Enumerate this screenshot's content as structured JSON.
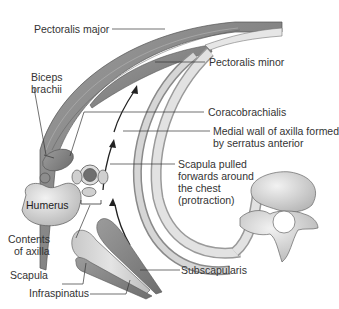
{
  "figure": {
    "type": "anatomical-diagram"
  },
  "labels": {
    "pectoralis_major": "Pectoralis major",
    "pectoralis_minor": "Pectoralis minor",
    "biceps_1": "Biceps",
    "biceps_2": "brachii",
    "coracobrachialis": "Coracobrachialis",
    "medial_wall_1": "Medial wall of axilla formed",
    "medial_wall_2": "by serratus anterior",
    "scapula_pulled_1": "Scapula pulled",
    "scapula_pulled_2": "forwards around",
    "scapula_pulled_3": "the chest",
    "scapula_pulled_4": "(protraction)",
    "humerus": "Humerus",
    "contents_1": "Contents",
    "contents_2": "of axilla",
    "scapula": "Scapula",
    "subscapularis": "Subscapularis",
    "infraspinatus": "Infraspinatus"
  },
  "colors": {
    "muscle_dark": "#7a7a7a",
    "muscle_mid": "#9a9a9a",
    "bone_light": "#d9d9d9",
    "bone_shade": "#bdbdbd",
    "leader_line": "#333333",
    "text": "#333333"
  }
}
